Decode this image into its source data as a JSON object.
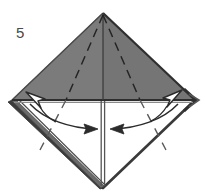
{
  "diagram": {
    "step_number": "5",
    "type": "origami-instruction",
    "canvas": {
      "width": 206,
      "height": 196
    },
    "colors": {
      "paper_shaded": "#7b7b7b",
      "paper_shaded_dark": "#6e6e6e",
      "paper_white": "#ffffff",
      "outline": "#3a3a3a",
      "edge_band": "#555555",
      "crease_dashed": "#2e2e2e",
      "arrow_stroke": "#2b2b2b",
      "arrowhead_fill": "#ffffff",
      "background": "#ffffff",
      "step_number_color": "#4a4a4a"
    },
    "shape": {
      "name": "diamond-square",
      "vertices": {
        "top": {
          "x": 103,
          "y": 13
        },
        "left": {
          "x": 12,
          "y": 100
        },
        "right": {
          "x": 195,
          "y": 100
        },
        "bottom": {
          "x": 103,
          "y": 188
        }
      },
      "upper_half_fill": "shaded-gray",
      "lower_half_fill": "white"
    },
    "creases": [
      {
        "name": "center-vertical-fold",
        "style": "solid",
        "from": "top",
        "to": "bottom"
      },
      {
        "name": "horizontal-raw-edge",
        "style": "solid",
        "from": "left",
        "to": "right"
      },
      {
        "name": "upper-left-valley-fold",
        "style": "dashed"
      },
      {
        "name": "upper-right-valley-fold",
        "style": "dashed"
      },
      {
        "name": "lower-left-valley-fold",
        "style": "dashed"
      },
      {
        "name": "lower-right-valley-fold",
        "style": "dashed"
      }
    ],
    "arrows": [
      {
        "name": "open-out-arrow-left",
        "style": "hollow-arrowhead",
        "direction": "up-left",
        "at": "left-corner"
      },
      {
        "name": "open-out-arrow-right",
        "style": "hollow-arrowhead",
        "direction": "up-right",
        "at": "right-corner"
      },
      {
        "name": "fold-in-arrow-left",
        "style": "curved-line-arrow",
        "direction": "right",
        "meaning": "fold flap toward center"
      },
      {
        "name": "fold-in-arrow-right",
        "style": "curved-line-arrow",
        "direction": "left",
        "meaning": "fold flap toward center"
      }
    ],
    "edges": {
      "lower_left_band": {
        "name": "layered-edge-band",
        "description": "thick dark band along lower-left edge showing paper layers"
      },
      "lower_right_line": {
        "name": "single-edge-line",
        "description": "thin dark line along lower-right edge"
      },
      "right_corner_chevron": {
        "name": "corner-chevron",
        "description": "dark chevron outline at right corner"
      }
    }
  }
}
